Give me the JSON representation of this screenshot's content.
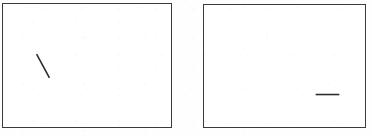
{
  "figure": {
    "canvas_width": 372,
    "canvas_height": 136,
    "background_color": "#fefefe",
    "border_color": "#3a3a3a",
    "segment_color": "#2b2b2b",
    "panel_fill_color": "#ffffff",
    "panel_count": 2
  },
  "panels": [
    {
      "id": "left",
      "name": "left-panel",
      "x": 2,
      "y": 3,
      "width": 170,
      "height": 125,
      "border_width": 1,
      "segment": {
        "name": "diagonal-line-segment",
        "orientation": "diagonal-descending",
        "x1": 34,
        "y1": 51,
        "x2": 47,
        "y2": 75,
        "length_px": 27,
        "angle_deg": 61.6,
        "stroke_width": 1.6
      }
    },
    {
      "id": "right",
      "name": "right-panel",
      "x": 203,
      "y": 4,
      "width": 163,
      "height": 124,
      "border_width": 1,
      "segment": {
        "name": "horizontal-line-segment",
        "orientation": "horizontal",
        "x1": 113,
        "y1": 91,
        "x2": 137,
        "y2": 91,
        "length_px": 24,
        "angle_deg": 0,
        "stroke_width": 1.6
      }
    }
  ]
}
